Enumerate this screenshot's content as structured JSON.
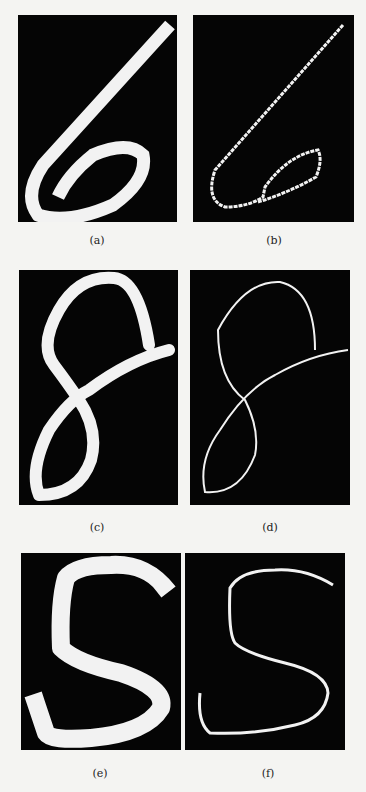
{
  "figure": {
    "panels": [
      {
        "id": "a",
        "caption": "(a)",
        "content": "handwritten digit 6, binary image"
      },
      {
        "id": "b",
        "caption": "(b)",
        "content": "digit 6 skeleton"
      },
      {
        "id": "c",
        "caption": "(c)",
        "content": "handwritten digit 8, binary image"
      },
      {
        "id": "d",
        "caption": "(d)",
        "content": "digit 8 skeleton"
      },
      {
        "id": "e",
        "caption": "(e)",
        "content": "handwritten letter S, binary image"
      },
      {
        "id": "f",
        "caption": "(f)",
        "content": "letter S skeleton"
      }
    ],
    "colors": {
      "background": "#050505",
      "stroke": "#f2f2f2",
      "page": "#f4f4f2"
    }
  }
}
